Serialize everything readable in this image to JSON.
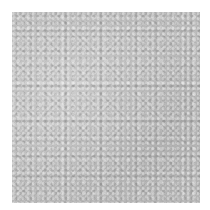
{
  "image": {
    "subject": "grey textured surface",
    "base_color": "#b9b9b9",
    "background_color": "#ffffff"
  }
}
